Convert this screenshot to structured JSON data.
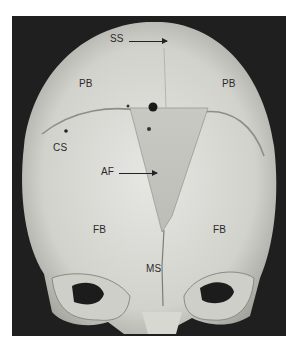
{
  "figure": {
    "labels": [
      {
        "id": "ss",
        "text": "SS"
      },
      {
        "id": "pb_left",
        "text": "PB"
      },
      {
        "id": "pb_right",
        "text": "PB"
      },
      {
        "id": "cs",
        "text": "CS"
      },
      {
        "id": "af",
        "text": "AF"
      },
      {
        "id": "fb_left",
        "text": "FB"
      },
      {
        "id": "fb_right",
        "text": "FB"
      },
      {
        "id": "ms",
        "text": "MS"
      }
    ],
    "colors": {
      "background": "#1f1f1f",
      "bone": "#d9d9d4",
      "bone_shadow": "#a9a9a4",
      "label": "#2a2a2a"
    }
  }
}
